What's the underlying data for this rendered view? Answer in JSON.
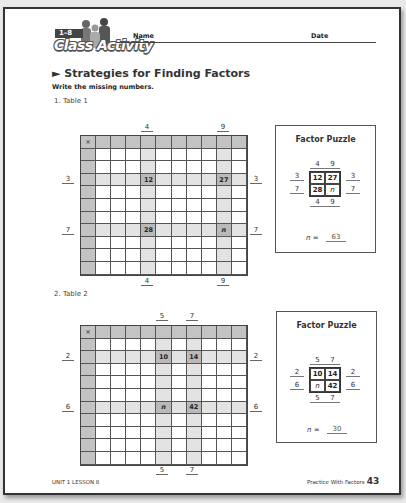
{
  "header": {
    "badge": "1–8",
    "activity_label": "Class Activity",
    "name_label": "Name",
    "date_label": "Date"
  },
  "section_title": "► Strategies for Finding Factors",
  "instructions": "Write the missing numbers.",
  "table1": {
    "label": "1. Table 1",
    "corner": "×",
    "col_factors": [
      "4",
      "9"
    ],
    "row_factors": [
      "3",
      "7"
    ],
    "products": {
      "r3c4": "12",
      "r3c9": "27",
      "r7c4": "28",
      "r7c9": "n"
    },
    "puzzle": {
      "title": "Factor Puzzle",
      "top": [
        "4",
        "9"
      ],
      "left": [
        "3",
        "7"
      ],
      "right": [
        "3",
        "7"
      ],
      "bottom": [
        "4",
        "9"
      ],
      "cells": [
        "12",
        "27",
        "28",
        "n"
      ],
      "answer_label": "n =",
      "answer": "63"
    }
  },
  "table2": {
    "label": "2. Table 2",
    "corner": "×",
    "col_factors": [
      "5",
      "7"
    ],
    "row_factors": [
      "2",
      "6"
    ],
    "products": {
      "r2c5": "10",
      "r2c7": "14",
      "r6c5": "n",
      "r6c7": "42"
    },
    "puzzle": {
      "title": "Factor Puzzle",
      "top": [
        "5",
        "7"
      ],
      "left": [
        "2",
        "6"
      ],
      "right": [
        "2",
        "6"
      ],
      "bottom": [
        "5",
        "7"
      ],
      "cells": [
        "10",
        "14",
        "n",
        "42"
      ],
      "answer_label": "n =",
      "answer": "30"
    }
  },
  "footer": {
    "left": "UNIT 1 LESSON 8",
    "right": "Practice With Factors",
    "page_number": "43"
  }
}
